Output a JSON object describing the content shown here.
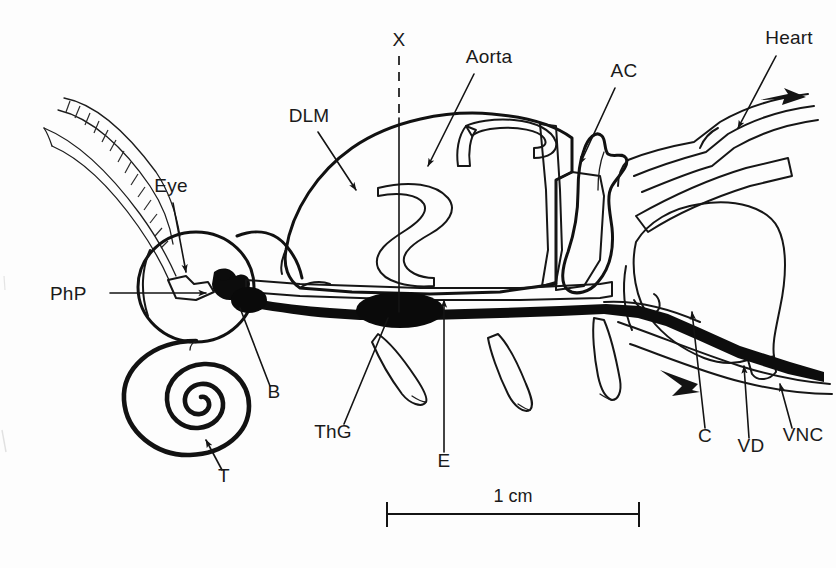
{
  "figure": {
    "kind": "anatomical-line-drawing",
    "view": "lateral / mid-sagittal",
    "background_color": "#fdfdfd",
    "ink_color": "#121212"
  },
  "labels": {
    "eye": "Eye",
    "php": "PhP",
    "b": "B",
    "t": "T",
    "thg": "ThG",
    "e": "E",
    "dlm": "DLM",
    "x": "X",
    "aorta": "Aorta",
    "ac": "AC",
    "heart": "Heart",
    "c": "C",
    "vd": "VD",
    "vnc": "VNC"
  },
  "scale": {
    "text": "1 cm",
    "bar_left_x": 386,
    "bar_right_x": 640,
    "bar_y": 514
  },
  "label_positions": {
    "eye": {
      "x": 171,
      "y": 192,
      "anchor": "middle"
    },
    "php": {
      "x": 50,
      "y": 300,
      "anchor": "start"
    },
    "b": {
      "x": 274,
      "y": 398,
      "anchor": "middle"
    },
    "t": {
      "x": 224,
      "y": 482,
      "anchor": "middle"
    },
    "thg": {
      "x": 333,
      "y": 438,
      "anchor": "middle"
    },
    "e": {
      "x": 444,
      "y": 467,
      "anchor": "middle"
    },
    "dlm": {
      "x": 309,
      "y": 122,
      "anchor": "middle"
    },
    "x": {
      "x": 399,
      "y": 46,
      "anchor": "middle"
    },
    "aorta": {
      "x": 489,
      "y": 63,
      "anchor": "middle"
    },
    "ac": {
      "x": 624,
      "y": 77,
      "anchor": "middle"
    },
    "heart": {
      "x": 789,
      "y": 44,
      "anchor": "middle"
    },
    "c": {
      "x": 705,
      "y": 442,
      "anchor": "middle"
    },
    "vd": {
      "x": 751,
      "y": 452,
      "anchor": "middle"
    },
    "vnc": {
      "x": 803,
      "y": 441,
      "anchor": "middle"
    }
  },
  "structures": [
    {
      "key": "antenna-segmented",
      "name": "segmented antenna (upper)",
      "shading": "dashed-segments"
    },
    {
      "key": "antenna-smooth",
      "name": "tapered antenna (lower)",
      "shading": "outline"
    },
    {
      "key": "eye",
      "name": "compound eye",
      "shading": "stipple"
    },
    {
      "key": "pharyngeal-pump",
      "name": "pharyngeal pump",
      "shading": "coarse-stipple"
    },
    {
      "key": "proboscis-coil",
      "name": "coiled proboscis",
      "shading": "solid-line-coil"
    },
    {
      "key": "brain",
      "name": "brain",
      "shading": "solid-black"
    },
    {
      "key": "dlm",
      "name": "dorsal longitudinal muscle",
      "shading": "horizontal-striations"
    },
    {
      "key": "aorta",
      "name": "aorta",
      "shading": "white-tube"
    },
    {
      "key": "accessory-chamber",
      "name": "accessory pulsatile chamber",
      "shading": "white"
    },
    {
      "key": "heart",
      "name": "dorsal heart vessel",
      "shading": "paired-lines"
    },
    {
      "key": "esophagus",
      "name": "esophagus / gut",
      "shading": "hatched-band"
    },
    {
      "key": "vnc",
      "name": "ventral nerve cord",
      "shading": "solid-black"
    },
    {
      "key": "thoracic-ganglion",
      "name": "thoracic ganglion",
      "shading": "solid-black-swelling"
    },
    {
      "key": "abdomen-organ",
      "name": "abdominal organ mass",
      "shading": "fine-stipple"
    },
    {
      "key": "legs",
      "name": "cut leg bases",
      "shading": "outline"
    },
    {
      "key": "vas-deferens",
      "name": "vas deferens",
      "shading": "line"
    },
    {
      "key": "crop",
      "name": "crop",
      "shading": "stipple"
    }
  ]
}
